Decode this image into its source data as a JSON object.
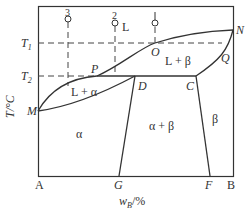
{
  "diagram": {
    "type": "binary-phase-diagram",
    "axes": {
      "y_label": "T/°C",
      "x_label": "w",
      "x_label_sub": "B",
      "x_label_suffix": "/%",
      "left_end": "A",
      "right_end": "B"
    },
    "temperatures": {
      "t1": "T",
      "t1_sub": "1",
      "t2": "T",
      "t2_sub": "2"
    },
    "points": {
      "M": "M",
      "N": "N",
      "O": "O",
      "P": "P",
      "Q": "Q",
      "D": "D",
      "C": "C",
      "G": "G",
      "F": "F"
    },
    "alloys": [
      "3",
      "2",
      "1"
    ],
    "regions": {
      "liquid": "L",
      "l_alpha": "L + α",
      "l_beta": "L + β",
      "alpha": "α",
      "alpha_beta": "α + β",
      "beta": "β"
    }
  }
}
